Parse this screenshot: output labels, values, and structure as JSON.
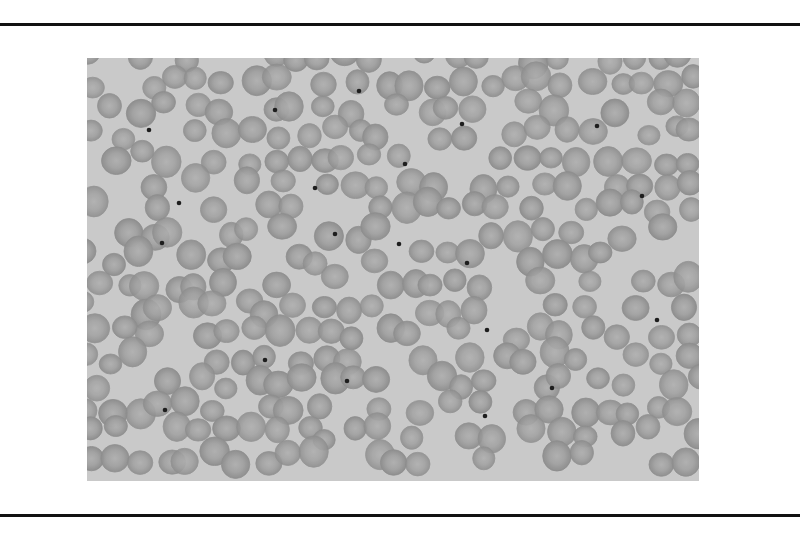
{
  "figure": {
    "colors": {
      "page_background": "#ffffff",
      "rule": "#111111",
      "field_background": "#c9c9c9",
      "cell_fill": "#a3a3a3",
      "cell_rim": "#8e8e8e",
      "cell_center": "#b0b0b0",
      "inclusion": "#1e1e1e"
    },
    "cell_radius": 13,
    "grid": {
      "cols": 24,
      "rows": 17,
      "spacing_x": 26,
      "spacing_y": 25,
      "seed": 7
    },
    "inclusions": [
      [
        62,
        72
      ],
      [
        188,
        52
      ],
      [
        272,
        33
      ],
      [
        375,
        66
      ],
      [
        92,
        145
      ],
      [
        248,
        176
      ],
      [
        312,
        186
      ],
      [
        380,
        205
      ],
      [
        75,
        185
      ],
      [
        400,
        272
      ],
      [
        570,
        262
      ],
      [
        178,
        302
      ],
      [
        260,
        323
      ],
      [
        398,
        358
      ],
      [
        78,
        352
      ],
      [
        510,
        68
      ],
      [
        555,
        138
      ],
      [
        465,
        330
      ],
      [
        318,
        106
      ],
      [
        228,
        130
      ]
    ]
  }
}
